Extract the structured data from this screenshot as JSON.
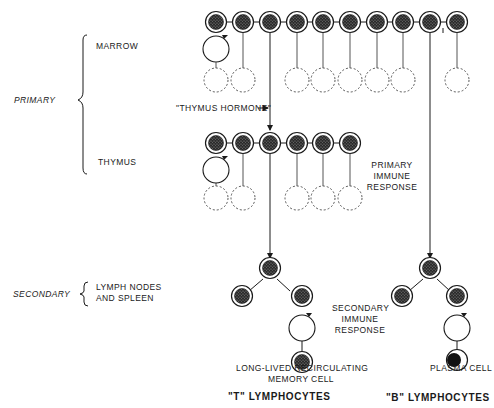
{
  "diagram": {
    "stages": {
      "primary": "PRIMARY",
      "secondary": "SECONDARY"
    },
    "organs": {
      "marrow": "MARROW",
      "thymus": "THYMUS",
      "lymph_nodes_line1": "LYMPH NODES",
      "lymph_nodes_line2": "AND SPLEEN"
    },
    "annotations": {
      "thymus_hormone": "\"THYMUS HORMONE\"",
      "primary_response_line1": "PRIMARY",
      "primary_response_line2": "IMMUNE",
      "primary_response_line3": "RESPONSE",
      "secondary_response_line1": "SECONDARY",
      "secondary_response_line2": "IMMUNE",
      "secondary_response_line3": "RESPONSE",
      "memory_cell_line1": "LONG-LIVED RECIRCULATING",
      "memory_cell_line2": "MEMORY CELL",
      "plasma_cell": "PLASMA CELL"
    },
    "lineages": {
      "t_cells": "\"T\" LYMPHOCYTES",
      "b_cells": "\"B\" LYMPHOCYTES"
    },
    "rows": {
      "marrow": {
        "cell_count": 10,
        "dead_cell_positions": [
          1,
          2,
          4,
          5,
          6,
          7,
          8,
          10
        ],
        "self_renewing_position": 1,
        "to_thymus_position": 3,
        "to_b_lineage_position": 9
      },
      "thymus": {
        "cell_count": 6,
        "dead_cell_positions": [
          1,
          2,
          4,
          5,
          6
        ],
        "self_renewing_position": 1,
        "to_t_lineage_position": 3
      }
    },
    "colors": {
      "ink": "#1a1a1a",
      "background": "#ffffff",
      "dashed": "#555555"
    }
  }
}
